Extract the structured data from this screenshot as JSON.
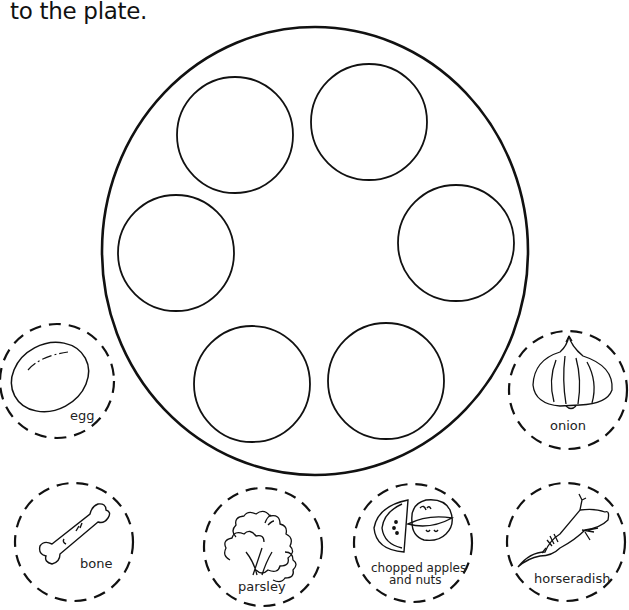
{
  "instruction": {
    "text": "to the plate."
  },
  "plate": {
    "center": [
      315,
      251
    ],
    "rx": 213,
    "ry": 224,
    "slots": [
      {
        "id": "slot-top-left",
        "cx": 235,
        "cy": 135
      },
      {
        "id": "slot-top-right",
        "cx": 369,
        "cy": 122
      },
      {
        "id": "slot-left",
        "cx": 176,
        "cy": 253
      },
      {
        "id": "slot-right",
        "cx": 456,
        "cy": 243
      },
      {
        "id": "slot-bottom-left",
        "cx": 252,
        "cy": 384
      },
      {
        "id": "slot-bottom-right",
        "cx": 386,
        "cy": 381
      }
    ]
  },
  "cutouts": [
    {
      "id": "egg",
      "label": "egg",
      "icon": "egg-icon",
      "cx": 57,
      "cy": 381
    },
    {
      "id": "onion",
      "label": "onion",
      "icon": "onion-icon",
      "cx": 568,
      "cy": 390
    },
    {
      "id": "bone",
      "label": "bone",
      "icon": "bone-icon",
      "cx": 74,
      "cy": 542
    },
    {
      "id": "parsley",
      "label": "parsley",
      "icon": "parsley-icon",
      "cx": 263,
      "cy": 547
    },
    {
      "id": "charoset",
      "label_line1": "chopped apples",
      "label_line2": "and nuts",
      "icon": "apples-nuts-icon",
      "cx": 413,
      "cy": 543
    },
    {
      "id": "horseradish",
      "label": "horseradish",
      "icon": "horseradish-icon",
      "cx": 566,
      "cy": 542
    }
  ],
  "colors": {
    "stroke": "#111111",
    "background": "#ffffff"
  }
}
